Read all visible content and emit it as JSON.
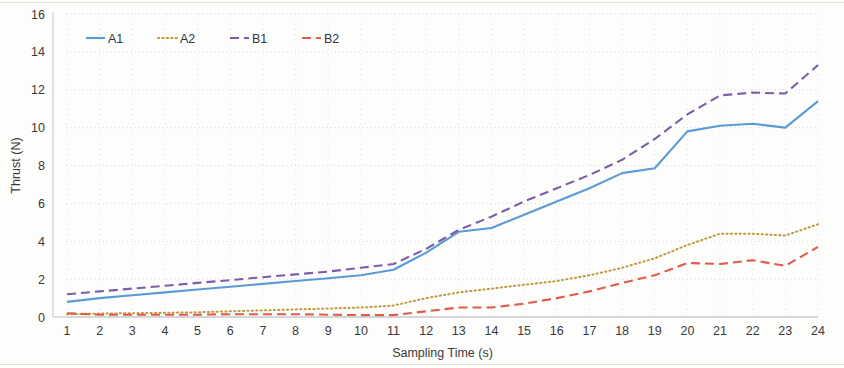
{
  "chart_data": {
    "type": "line",
    "title": "",
    "xlabel": "Sampling Time (s)",
    "ylabel": "Thrust (N)",
    "xlim": [
      1,
      24
    ],
    "ylim": [
      0,
      16
    ],
    "ytick_step": 2,
    "grid": "horizontal-and-vertical-dotted",
    "legend_position": "top-left-inside",
    "x": [
      1,
      2,
      3,
      4,
      5,
      6,
      7,
      8,
      9,
      10,
      11,
      12,
      13,
      14,
      15,
      16,
      17,
      18,
      19,
      20,
      21,
      22,
      23,
      24
    ],
    "xtick_labels": [
      "1",
      "2",
      "3",
      "4",
      "5",
      "6",
      "7",
      "8",
      "9",
      "10",
      "11",
      "12",
      "13",
      "14",
      "15",
      "16",
      "17",
      "18",
      "19",
      "20",
      "21",
      "22",
      "23",
      "24"
    ],
    "ytick_labels": [
      "0",
      "2",
      "4",
      "6",
      "8",
      "10",
      "12",
      "14",
      "16"
    ],
    "series": [
      {
        "name": "A1",
        "color": "#5b9bd5",
        "style": "solid",
        "values": [
          0.8,
          1.0,
          1.15,
          1.3,
          1.45,
          1.6,
          1.75,
          1.9,
          2.05,
          2.2,
          2.5,
          3.4,
          4.5,
          4.7,
          5.4,
          6.1,
          6.8,
          7.6,
          7.85,
          9.8,
          10.1,
          10.2,
          10.0,
          11.4
        ]
      },
      {
        "name": "A2",
        "color": "#bf9a3c",
        "style": "dotted",
        "values": [
          0.15,
          0.18,
          0.2,
          0.22,
          0.25,
          0.3,
          0.35,
          0.4,
          0.45,
          0.5,
          0.6,
          1.0,
          1.3,
          1.5,
          1.7,
          1.9,
          2.2,
          2.6,
          3.1,
          3.8,
          4.4,
          4.4,
          4.3,
          4.9
        ]
      },
      {
        "name": "B1",
        "color": "#7b5ea7",
        "style": "dashed",
        "values": [
          1.2,
          1.35,
          1.5,
          1.65,
          1.8,
          1.95,
          2.1,
          2.25,
          2.4,
          2.6,
          2.8,
          3.6,
          4.6,
          5.3,
          6.1,
          6.8,
          7.5,
          8.3,
          9.4,
          10.7,
          11.7,
          11.85,
          11.8,
          13.3
        ]
      },
      {
        "name": "B2",
        "color": "#e05b4c",
        "style": "dashed",
        "values": [
          0.2,
          0.12,
          0.12,
          0.12,
          0.12,
          0.15,
          0.15,
          0.15,
          0.12,
          0.1,
          0.1,
          0.3,
          0.5,
          0.5,
          0.7,
          1.0,
          1.35,
          1.8,
          2.2,
          2.85,
          2.8,
          3.0,
          2.7,
          3.7
        ]
      }
    ]
  },
  "legend": {
    "items": [
      {
        "label": "A1",
        "color": "#5b9bd5",
        "style": "solid"
      },
      {
        "label": "A2",
        "color": "#bf9a3c",
        "style": "dotted"
      },
      {
        "label": "B1",
        "color": "#7b5ea7",
        "style": "dashed"
      },
      {
        "label": "B2",
        "color": "#e05b4c",
        "style": "dashed"
      }
    ]
  },
  "axes": {
    "y_title": "Thrust (N)",
    "x_title": "Sampling Time (s)"
  }
}
